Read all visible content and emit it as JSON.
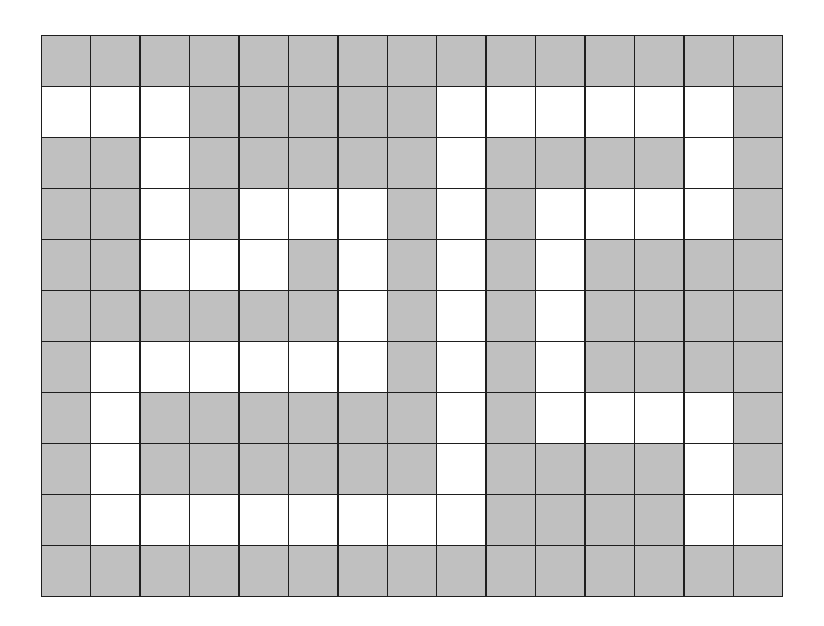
{
  "maze": {
    "rows": 11,
    "cols": 15,
    "colors": {
      "wall": "#c0c0c0",
      "path": "#ffffff",
      "grid_line": "#1e1e1e"
    },
    "legend": {
      "1": "path (white)",
      "0": "wall (gray)"
    },
    "grid": [
      "000000000000000",
      "111000001111110",
      "001000001000010",
      "001011101011110",
      "001110101010000",
      "000000101010000",
      "011111101010000",
      "010000001011110",
      "010000001000010",
      "011111111000011",
      "000000000000000"
    ],
    "entrance": {
      "row": 1,
      "col": 0
    },
    "exit": {
      "row": 9,
      "col": 14
    }
  }
}
